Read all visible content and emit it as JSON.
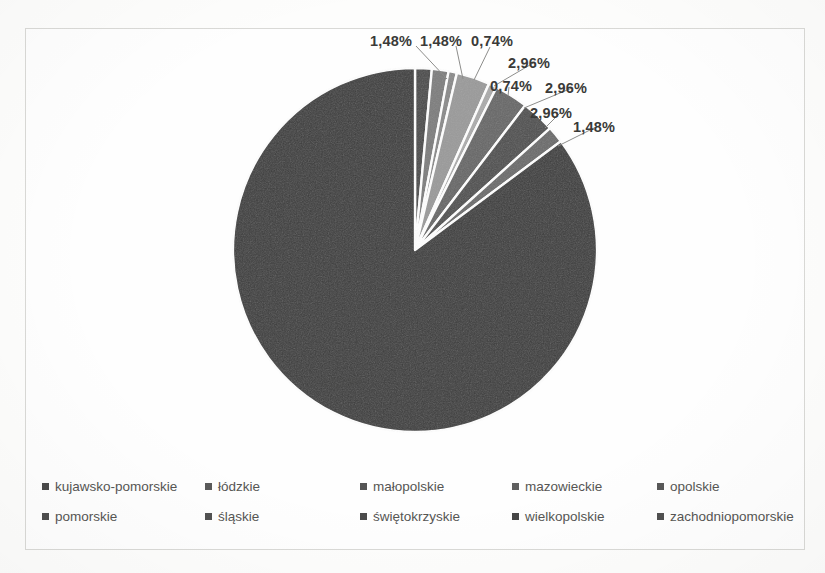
{
  "chart_data": {
    "type": "pie",
    "title": "",
    "subtitle": "",
    "xlabel": "",
    "ylabel": "",
    "grid": false,
    "legend_position": "bottom",
    "label_format": "percent-comma-decimal",
    "categories": [
      "kujawsko-pomorskie",
      "łódzkie",
      "małopolskie",
      "mazowieckie",
      "opolskie",
      "pomorskie",
      "śląskie",
      "świętokrzyskie",
      "wielkopolskie",
      "zachodniopomorskie"
    ],
    "values": [
      1.48,
      1.48,
      0.74,
      2.96,
      0.74,
      2.96,
      2.96,
      1.48,
      85.19,
      0.0
    ],
    "labels": [
      "1,48%",
      "1,48%",
      "0,74%",
      "2,96%",
      "0,74%",
      "2,96%",
      "2,96%",
      "1,48%",
      "85,19%"
    ],
    "slice_colors": [
      "#3b3b3b",
      "#6e6e6e",
      "#8f8f8f",
      "#757575",
      "#a6a6a6",
      "#5e5e5e",
      "#4a4a4a",
      "#6a6a6a",
      "#3f3f3f",
      "#555555"
    ],
    "total_labeled": 99.99
  },
  "pie": {
    "center_x": 415,
    "center_y": 250,
    "radius": 182,
    "start_angle_deg": -90,
    "separator_color": "#ffffff",
    "separator_width": 2.4,
    "slices": [
      {
        "name": "kujawsko-pomorskie",
        "value": 1.48,
        "color": "#4a4a4a"
      },
      {
        "name": "łódzkie",
        "value": 1.48,
        "color": "#7d7d7d"
      },
      {
        "name": "małopolskie",
        "value": 0.74,
        "color": "#8a8a8a"
      },
      {
        "name": "mazowieckie",
        "value": 2.96,
        "color": "#9a9a9a"
      },
      {
        "name": "opolskie",
        "value": 0.74,
        "color": "#ababab"
      },
      {
        "name": "pomorskie",
        "value": 2.96,
        "color": "#676767"
      },
      {
        "name": "śląskie",
        "value": 2.96,
        "color": "#4f4f4f"
      },
      {
        "name": "świętokrzyskie",
        "value": 1.48,
        "color": "#6b6b6b"
      },
      {
        "name": "wielkopolskie",
        "value": 85.19,
        "color": "#3d3d3d"
      }
    ]
  },
  "callouts": [
    {
      "text": "1,48%",
      "x": 370,
      "y": 33,
      "leader": {
        "x1": 416,
        "y1": 46,
        "x2": 447,
        "y2": 79
      }
    },
    {
      "text": "1,48%",
      "x": 420,
      "y": 33,
      "leader": {
        "x1": 456,
        "y1": 46,
        "x2": 463,
        "y2": 79
      }
    },
    {
      "text": "0,74%",
      "x": 471,
      "y": 33,
      "leader": {
        "x1": 490,
        "y1": 47,
        "x2": 474,
        "y2": 80
      }
    },
    {
      "text": "2,96%",
      "x": 508,
      "y": 55,
      "leader": {
        "x1": 535,
        "y1": 62,
        "x2": 494,
        "y2": 86
      }
    },
    {
      "text": "0,74%",
      "x": 490,
      "y": 78,
      "leader": {
        "x1": 509,
        "y1": 87,
        "x2": 508,
        "y2": 96
      }
    },
    {
      "text": "2,96%",
      "x": 545,
      "y": 80,
      "leader": {
        "x1": 572,
        "y1": 88,
        "x2": 524,
        "y2": 108
      }
    },
    {
      "text": "2,96%",
      "x": 530,
      "y": 105,
      "leader": {
        "x1": 560,
        "y1": 113,
        "x2": 545,
        "y2": 128
      }
    },
    {
      "text": "1,48%",
      "x": 573,
      "y": 119,
      "leader": {
        "x1": 596,
        "y1": 127,
        "x2": 558,
        "y2": 146
      }
    }
  ],
  "center_label": {
    "text": "85,19%",
    "x": 322,
    "y": 376
  },
  "legend": {
    "rows": [
      [
        {
          "label": "kujawsko-pomorskie",
          "color": "#4a4a4a"
        },
        {
          "label": "łódzkie",
          "color": "#5a5a5a"
        },
        {
          "label": "małopolskie",
          "color": "#555555"
        },
        {
          "label": "mazowieckie",
          "color": "#5f5f5f"
        },
        {
          "label": "opolskie",
          "color": "#585858"
        }
      ],
      [
        {
          "label": "pomorskie",
          "color": "#4e4e4e"
        },
        {
          "label": "śląskie",
          "color": "#525252"
        },
        {
          "label": "świętokrzyskie",
          "color": "#4b4b4b"
        },
        {
          "label": "wielkopolskie",
          "color": "#464646"
        },
        {
          "label": "zachodniopomorskie",
          "color": "#505050"
        }
      ]
    ]
  }
}
